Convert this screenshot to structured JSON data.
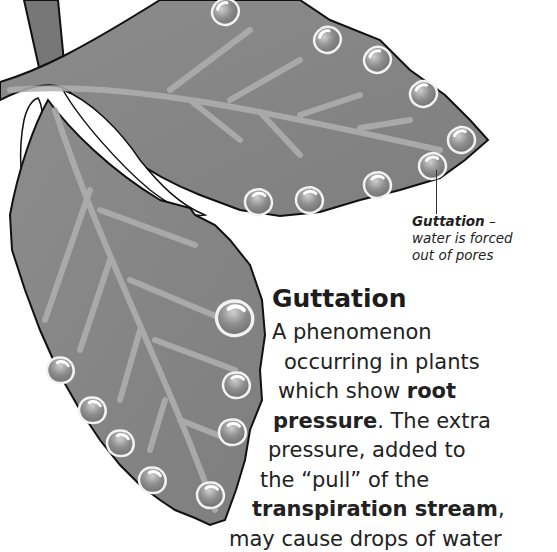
{
  "illustration": {
    "subject": "leaf-with-guttation-droplets",
    "colors": {
      "leaf": "#8a8a8a",
      "vein": "#b4b4b4",
      "outline": "#111111",
      "droplet": "#9a9a9a",
      "droplet_highlight": "#eeeeee"
    }
  },
  "callout": {
    "term": "Guttation",
    "dash": " –",
    "desc_line1": "water is forced",
    "desc_line2": "out of pores"
  },
  "article": {
    "heading": "Guttation",
    "lines": [
      {
        "pre": "A phenomenon",
        "bold": "",
        "post": ""
      },
      {
        "pre": "occurring in plants",
        "bold": "",
        "post": ""
      },
      {
        "pre": "which show ",
        "bold": "root",
        "post": ""
      },
      {
        "pre": "",
        "bold": "pressure",
        "post": ". The extra"
      },
      {
        "pre": "pressure, added to",
        "bold": "",
        "post": ""
      },
      {
        "pre": "the “pull” of the",
        "bold": "",
        "post": ""
      },
      {
        "pre": "",
        "bold": "transpiration stream",
        "post": ","
      },
      {
        "pre": "may cause drops of water",
        "bold": "",
        "post": ""
      }
    ]
  }
}
